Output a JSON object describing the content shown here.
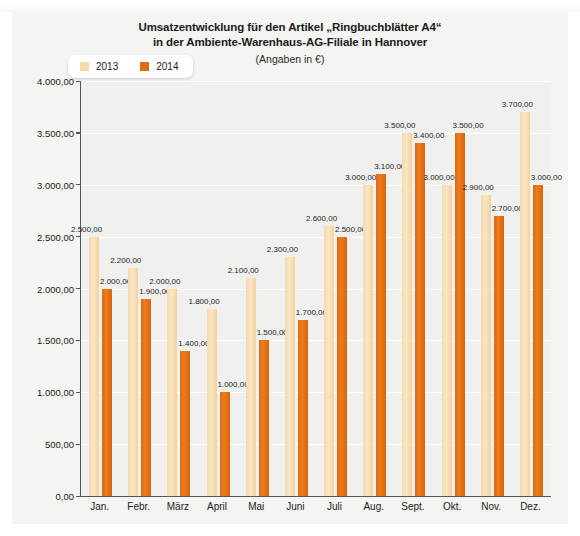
{
  "chart_data": {
    "type": "bar",
    "title": "Umsatzentwicklung für den Artikel „Ringbuchblätter A4“",
    "title_line2": "in der Ambiente-Warenhaus-AG-Filiale in Hannover",
    "subtitle": "(Angaben in €)",
    "xlabel": "",
    "ylabel": "",
    "ylim": [
      0,
      4000
    ],
    "ytick_step": 500,
    "grid": true,
    "legend_position": "top-left",
    "categories": [
      "Jan.",
      "Febr.",
      "März",
      "April",
      "Mai",
      "Juni",
      "Juli",
      "Aug.",
      "Sept.",
      "Okt.",
      "Nov.",
      "Dez."
    ],
    "ytick_labels": [
      "0,00",
      "500,00",
      "1.000,00",
      "1.500,00",
      "2.000,00",
      "2.500,00",
      "3.000,00",
      "3.500,00",
      "4.000,00"
    ],
    "ytick_values": [
      0,
      500,
      1000,
      1500,
      2000,
      2500,
      3000,
      3500,
      4000
    ],
    "series": [
      {
        "name": "2013",
        "color": "#f6d9ab",
        "values": [
          2500,
          2200,
          2000,
          1800,
          2100,
          2300,
          2600,
          3000,
          3500,
          3000,
          2900,
          3700
        ],
        "labels": [
          "2.500,00",
          "2.200,00",
          "2.000,00",
          "1.800,00",
          "2.100,00",
          "2.300,00",
          "2.600,00",
          "3.000,00",
          "3.500,00",
          "3.000,00",
          "2.900,00",
          "3.700,00"
        ]
      },
      {
        "name": "2014",
        "color": "#e06a10",
        "values": [
          2000,
          1900,
          1400,
          1000,
          1500,
          1700,
          2500,
          3100,
          3400,
          3500,
          2700,
          3000
        ],
        "labels": [
          "2.000,00",
          "1.900,00",
          "1.400,00",
          "1.000,00",
          "1.500,00",
          "1.700,00",
          "2.500,00",
          "3.100,00",
          "3.400,00",
          "3.500,00",
          "2.700,00",
          "3.000,00"
        ]
      }
    ]
  },
  "legend": {
    "items": [
      {
        "label": "2013",
        "color": "#f6d9ab"
      },
      {
        "label": "2014",
        "color": "#e06a10"
      }
    ]
  }
}
